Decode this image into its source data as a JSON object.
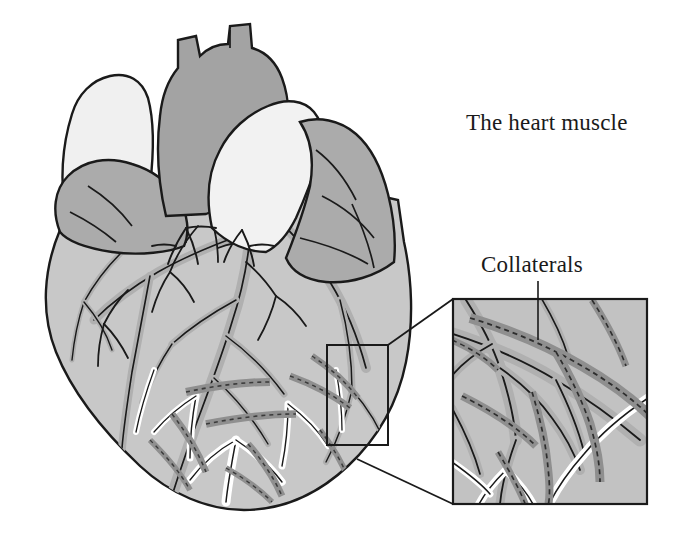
{
  "figure": {
    "name": "heart-muscle-collaterals-illustration",
    "background_color": "#ffffff"
  },
  "labels": {
    "title": "The heart muscle",
    "collaterals": "Collaterals"
  },
  "palette": {
    "outline": "#1a1a1a",
    "myocardium_fill": "#c8c8c8",
    "atrium_fill": "#ababab",
    "aorta_fill": "#a3a3a3",
    "pulmonary_fill": "#f2f2f2",
    "vena_cava_fill": "#f0f0f0",
    "artery_fill": "#b0b0b0",
    "collateral_fill": "#8f8f8f",
    "vein_fill": "#ffffff",
    "inset_fill": "#c2c2c2",
    "inset_border": "#1a1a1a",
    "leader_line": "#1a1a1a"
  },
  "anatomy": {
    "heart_body": "myocardium-ventricles",
    "great_vessels": [
      "aorta",
      "pulmonary-trunk",
      "superior-vena-cava",
      "left-atrial-appendage",
      "right-atrial-appendage"
    ],
    "vessel_types": [
      "coronary-artery",
      "coronary-vein",
      "collateral-vessel"
    ]
  },
  "inset": {
    "name": "magnified-detail-box",
    "source_box": {
      "x": 327,
      "y": 345,
      "width": 61,
      "height": 100
    },
    "detail_box": {
      "x": 452,
      "y": 298,
      "width": 196,
      "height": 207
    },
    "depicts": "collateral-vessels-magnified"
  }
}
